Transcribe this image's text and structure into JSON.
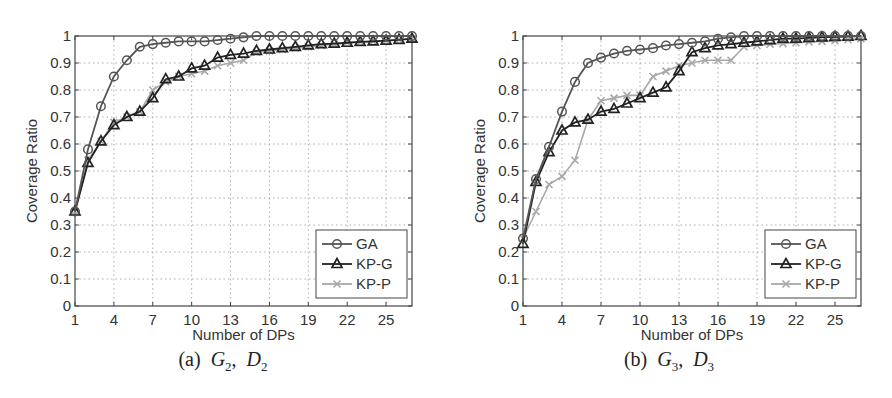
{
  "chart_data": [
    {
      "type": "line",
      "panel_label": "(a)",
      "caption": {
        "label": "(a)",
        "g": "G",
        "g_sub": "2",
        "d": "D",
        "d_sub": "2"
      },
      "title": "",
      "xlabel": "Number of DPs",
      "ylabel": "Coverage Ratio",
      "xlim": [
        1,
        27
      ],
      "ylim": [
        0,
        1
      ],
      "xticks": [
        1,
        4,
        7,
        10,
        13,
        16,
        19,
        22,
        25
      ],
      "yticks": [
        0,
        0.1,
        0.2,
        0.3,
        0.4,
        0.5,
        0.6,
        0.7,
        0.8,
        0.9,
        1
      ],
      "ytick_labels": [
        "0",
        "0.1",
        "0.2",
        "0.3",
        "0.4",
        "0.5",
        "0.6",
        "0.7",
        "0.8",
        "0.9",
        "1"
      ],
      "grid": true,
      "legend_position": "lower right",
      "x": [
        1,
        2,
        3,
        4,
        5,
        6,
        7,
        8,
        9,
        10,
        11,
        12,
        13,
        14,
        15,
        16,
        17,
        18,
        19,
        20,
        21,
        22,
        23,
        24,
        25,
        26,
        27
      ],
      "series": [
        {
          "name": "GA",
          "marker": "circle",
          "color": "#555555",
          "values": [
            0.35,
            0.58,
            0.74,
            0.85,
            0.91,
            0.96,
            0.97,
            0.975,
            0.98,
            0.98,
            0.98,
            0.985,
            0.99,
            0.995,
            1.0,
            1.0,
            1.0,
            1.0,
            1.0,
            1.0,
            1.0,
            1.0,
            1.0,
            1.0,
            1.0,
            1.0,
            1.0
          ]
        },
        {
          "name": "KP-G",
          "marker": "triangle",
          "color": "#222222",
          "values": [
            0.35,
            0.53,
            0.61,
            0.67,
            0.7,
            0.72,
            0.77,
            0.84,
            0.85,
            0.88,
            0.89,
            0.92,
            0.93,
            0.935,
            0.945,
            0.95,
            0.955,
            0.96,
            0.965,
            0.97,
            0.972,
            0.975,
            0.978,
            0.98,
            0.983,
            0.986,
            0.99
          ]
        },
        {
          "name": "KP-P",
          "marker": "x",
          "color": "#a8a8a8",
          "values": [
            0.35,
            0.54,
            0.61,
            0.68,
            0.7,
            0.72,
            0.8,
            0.83,
            0.85,
            0.86,
            0.87,
            0.89,
            0.9,
            0.91,
            0.94,
            0.945,
            0.95,
            0.955,
            0.96,
            0.965,
            0.97,
            0.975,
            0.978,
            0.98,
            0.983,
            0.986,
            0.99
          ]
        }
      ]
    },
    {
      "type": "line",
      "panel_label": "(b)",
      "caption": {
        "label": "(b)",
        "g": "G",
        "g_sub": "3",
        "d": "D",
        "d_sub": "3"
      },
      "title": "",
      "xlabel": "Number of DPs",
      "ylabel": "Coverage Ratio",
      "xlim": [
        1,
        27
      ],
      "ylim": [
        0,
        1
      ],
      "xticks": [
        1,
        4,
        7,
        10,
        13,
        16,
        19,
        22,
        25
      ],
      "yticks": [
        0,
        0.1,
        0.2,
        0.3,
        0.4,
        0.5,
        0.6,
        0.7,
        0.8,
        0.9,
        1
      ],
      "ytick_labels": [
        "0",
        "0.1",
        "0.2",
        "0.3",
        "0.4",
        "0.5",
        "0.6",
        "0.7",
        "0.8",
        "0.9",
        "1"
      ],
      "grid": true,
      "legend_position": "lower right",
      "x": [
        1,
        2,
        3,
        4,
        5,
        6,
        7,
        8,
        9,
        10,
        11,
        12,
        13,
        14,
        15,
        16,
        17,
        18,
        19,
        20,
        21,
        22,
        23,
        24,
        25,
        26,
        27
      ],
      "series": [
        {
          "name": "GA",
          "marker": "circle",
          "color": "#555555",
          "values": [
            0.25,
            0.47,
            0.59,
            0.72,
            0.83,
            0.9,
            0.92,
            0.935,
            0.945,
            0.95,
            0.955,
            0.965,
            0.97,
            0.975,
            0.98,
            0.99,
            0.995,
            1.0,
            1.0,
            1.0,
            1.0,
            1.0,
            1.0,
            1.0,
            1.0,
            1.0,
            1.0
          ]
        },
        {
          "name": "KP-G",
          "marker": "triangle",
          "color": "#222222",
          "values": [
            0.23,
            0.46,
            0.57,
            0.65,
            0.68,
            0.69,
            0.72,
            0.73,
            0.75,
            0.77,
            0.79,
            0.81,
            0.87,
            0.94,
            0.955,
            0.965,
            0.97,
            0.975,
            0.98,
            0.985,
            0.99,
            0.99,
            0.993,
            0.995,
            0.997,
            0.998,
            1.0
          ]
        },
        {
          "name": "KP-P",
          "marker": "x",
          "color": "#a8a8a8",
          "values": [
            0.25,
            0.35,
            0.45,
            0.48,
            0.54,
            0.69,
            0.76,
            0.77,
            0.78,
            0.78,
            0.85,
            0.87,
            0.89,
            0.9,
            0.91,
            0.91,
            0.91,
            0.96,
            0.965,
            0.97,
            0.972,
            0.975,
            0.978,
            0.98,
            0.983,
            0.986,
            0.99
          ]
        }
      ]
    }
  ]
}
